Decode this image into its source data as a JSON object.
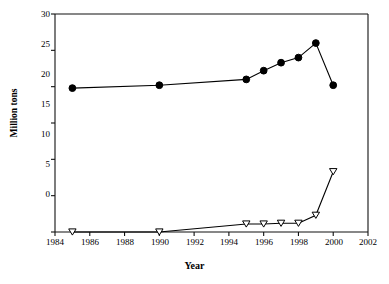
{
  "chart_data": {
    "type": "line",
    "title": "",
    "xlabel": "Year",
    "ylabel": "Million tons",
    "xlim": [
      1984,
      2002
    ],
    "ylim": [
      0,
      30
    ],
    "xticks": [
      1984,
      1986,
      1988,
      1990,
      1992,
      1994,
      1996,
      1998,
      2000,
      2002
    ],
    "yticks": [
      0,
      5,
      10,
      15,
      20,
      25,
      30
    ],
    "grid": false,
    "legend": "none",
    "series": [
      {
        "name": "filled-circle-series",
        "marker": "filled-circle",
        "color": "#000000",
        "x": [
          1985,
          1990,
          1995,
          1996,
          1997,
          1998,
          1999,
          2000
        ],
        "values": [
          19.8,
          20.2,
          21.0,
          22.2,
          23.3,
          24.0,
          26.0,
          20.2
        ]
      },
      {
        "name": "open-triangle-series",
        "marker": "open-down-triangle",
        "color": "#000000",
        "x": [
          1985,
          1990,
          1995,
          1996,
          1997,
          1998,
          1999,
          2000
        ],
        "values": [
          0.0,
          0.0,
          1.1,
          1.1,
          1.2,
          1.2,
          2.3,
          8.3
        ]
      }
    ]
  },
  "axis": {
    "y_tick_labels": [
      "30",
      "25",
      "20",
      "15",
      "10",
      "5",
      "0"
    ],
    "x_tick_labels": [
      "1984",
      "1986",
      "1988",
      "1990",
      "1992",
      "1994",
      "1996",
      "1998",
      "2000",
      "2002"
    ]
  }
}
